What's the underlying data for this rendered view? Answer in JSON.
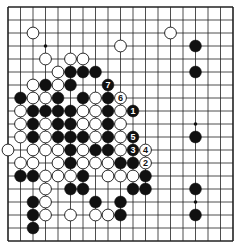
{
  "diagram": {
    "type": "go-board",
    "board_size": 19,
    "colors": {
      "black": "#111111",
      "white": "#ffffff",
      "line": "#222222",
      "background": "#ffffff"
    },
    "star_points": [
      [
        3,
        3
      ],
      [
        3,
        9
      ],
      [
        3,
        15
      ],
      [
        9,
        3
      ],
      [
        9,
        9
      ],
      [
        9,
        15
      ],
      [
        15,
        3
      ],
      [
        15,
        9
      ],
      [
        15,
        15
      ]
    ],
    "stones": [
      {
        "c": 2,
        "r": 2,
        "color": "white"
      },
      {
        "c": 13,
        "r": 2,
        "color": "white"
      },
      {
        "c": 9,
        "r": 3,
        "color": "white"
      },
      {
        "c": 15,
        "r": 3,
        "color": "black"
      },
      {
        "c": 3,
        "r": 4,
        "color": "white"
      },
      {
        "c": 5,
        "r": 4,
        "color": "white"
      },
      {
        "c": 6,
        "r": 4,
        "color": "white"
      },
      {
        "c": 4,
        "r": 5,
        "color": "white"
      },
      {
        "c": 5,
        "r": 5,
        "color": "black"
      },
      {
        "c": 6,
        "r": 5,
        "color": "black"
      },
      {
        "c": 7,
        "r": 5,
        "color": "black"
      },
      {
        "c": 15,
        "r": 5,
        "color": "black"
      },
      {
        "c": 2,
        "r": 6,
        "color": "white"
      },
      {
        "c": 3,
        "r": 6,
        "color": "black"
      },
      {
        "c": 4,
        "r": 6,
        "color": "white"
      },
      {
        "c": 5,
        "r": 6,
        "color": "black"
      },
      {
        "c": 8,
        "r": 6,
        "color": "black",
        "label": "7"
      },
      {
        "c": 1,
        "r": 7,
        "color": "black"
      },
      {
        "c": 2,
        "r": 7,
        "color": "white"
      },
      {
        "c": 3,
        "r": 7,
        "color": "white"
      },
      {
        "c": 4,
        "r": 7,
        "color": "black"
      },
      {
        "c": 6,
        "r": 7,
        "color": "black"
      },
      {
        "c": 7,
        "r": 7,
        "color": "white"
      },
      {
        "c": 8,
        "r": 7,
        "color": "black"
      },
      {
        "c": 9,
        "r": 7,
        "color": "white",
        "label": "6"
      },
      {
        "c": 1,
        "r": 8,
        "color": "white"
      },
      {
        "c": 2,
        "r": 8,
        "color": "black"
      },
      {
        "c": 3,
        "r": 8,
        "color": "black"
      },
      {
        "c": 4,
        "r": 8,
        "color": "black"
      },
      {
        "c": 5,
        "r": 8,
        "color": "black"
      },
      {
        "c": 6,
        "r": 8,
        "color": "white"
      },
      {
        "c": 7,
        "r": 8,
        "color": "white"
      },
      {
        "c": 8,
        "r": 8,
        "color": "black"
      },
      {
        "c": 9,
        "r": 8,
        "color": "white"
      },
      {
        "c": 10,
        "r": 8,
        "color": "black",
        "label": "1"
      },
      {
        "c": 1,
        "r": 9,
        "color": "white"
      },
      {
        "c": 2,
        "r": 9,
        "color": "black"
      },
      {
        "c": 3,
        "r": 9,
        "color": "white"
      },
      {
        "c": 4,
        "r": 9,
        "color": "black"
      },
      {
        "c": 5,
        "r": 9,
        "color": "black"
      },
      {
        "c": 6,
        "r": 9,
        "color": "white"
      },
      {
        "c": 7,
        "r": 9,
        "color": "white"
      },
      {
        "c": 8,
        "r": 9,
        "color": "black"
      },
      {
        "c": 9,
        "r": 9,
        "color": "white"
      },
      {
        "c": 1,
        "r": 10,
        "color": "white"
      },
      {
        "c": 2,
        "r": 10,
        "color": "black"
      },
      {
        "c": 3,
        "r": 10,
        "color": "white"
      },
      {
        "c": 4,
        "r": 10,
        "color": "black"
      },
      {
        "c": 5,
        "r": 10,
        "color": "black"
      },
      {
        "c": 6,
        "r": 10,
        "color": "black"
      },
      {
        "c": 7,
        "r": 10,
        "color": "white"
      },
      {
        "c": 8,
        "r": 10,
        "color": "black"
      },
      {
        "c": 9,
        "r": 10,
        "color": "white"
      },
      {
        "c": 10,
        "r": 10,
        "color": "black",
        "label": "5"
      },
      {
        "c": 15,
        "r": 10,
        "color": "black"
      },
      {
        "c": 0,
        "r": 11,
        "color": "white"
      },
      {
        "c": 2,
        "r": 11,
        "color": "white"
      },
      {
        "c": 3,
        "r": 11,
        "color": "white"
      },
      {
        "c": 4,
        "r": 11,
        "color": "white"
      },
      {
        "c": 5,
        "r": 11,
        "color": "black"
      },
      {
        "c": 6,
        "r": 11,
        "color": "white"
      },
      {
        "c": 7,
        "r": 11,
        "color": "black"
      },
      {
        "c": 8,
        "r": 11,
        "color": "black"
      },
      {
        "c": 9,
        "r": 11,
        "color": "white"
      },
      {
        "c": 10,
        "r": 11,
        "color": "black",
        "label": "3"
      },
      {
        "c": 11,
        "r": 11,
        "color": "white",
        "label": "4"
      },
      {
        "c": 1,
        "r": 12,
        "color": "white"
      },
      {
        "c": 2,
        "r": 12,
        "color": "white"
      },
      {
        "c": 4,
        "r": 12,
        "color": "white"
      },
      {
        "c": 5,
        "r": 12,
        "color": "black"
      },
      {
        "c": 6,
        "r": 12,
        "color": "white"
      },
      {
        "c": 7,
        "r": 12,
        "color": "white"
      },
      {
        "c": 8,
        "r": 12,
        "color": "white"
      },
      {
        "c": 9,
        "r": 12,
        "color": "black"
      },
      {
        "c": 10,
        "r": 12,
        "color": "black"
      },
      {
        "c": 11,
        "r": 12,
        "color": "white",
        "label": "2"
      },
      {
        "c": 1,
        "r": 13,
        "color": "black"
      },
      {
        "c": 2,
        "r": 13,
        "color": "black"
      },
      {
        "c": 3,
        "r": 13,
        "color": "white"
      },
      {
        "c": 4,
        "r": 13,
        "color": "white"
      },
      {
        "c": 5,
        "r": 13,
        "color": "white"
      },
      {
        "c": 6,
        "r": 13,
        "color": "black"
      },
      {
        "c": 8,
        "r": 13,
        "color": "white"
      },
      {
        "c": 9,
        "r": 13,
        "color": "white"
      },
      {
        "c": 10,
        "r": 13,
        "color": "white"
      },
      {
        "c": 11,
        "r": 13,
        "color": "black"
      },
      {
        "c": 3,
        "r": 14,
        "color": "white"
      },
      {
        "c": 5,
        "r": 14,
        "color": "black"
      },
      {
        "c": 6,
        "r": 14,
        "color": "black"
      },
      {
        "c": 10,
        "r": 14,
        "color": "black"
      },
      {
        "c": 11,
        "r": 14,
        "color": "black"
      },
      {
        "c": 15,
        "r": 14,
        "color": "black"
      },
      {
        "c": 2,
        "r": 15,
        "color": "black"
      },
      {
        "c": 3,
        "r": 15,
        "color": "white"
      },
      {
        "c": 7,
        "r": 15,
        "color": "black"
      },
      {
        "c": 9,
        "r": 15,
        "color": "black"
      },
      {
        "c": 2,
        "r": 16,
        "color": "black"
      },
      {
        "c": 3,
        "r": 16,
        "color": "white"
      },
      {
        "c": 5,
        "r": 16,
        "color": "white"
      },
      {
        "c": 7,
        "r": 16,
        "color": "white"
      },
      {
        "c": 8,
        "r": 16,
        "color": "white"
      },
      {
        "c": 9,
        "r": 16,
        "color": "black"
      },
      {
        "c": 15,
        "r": 16,
        "color": "black"
      },
      {
        "c": 2,
        "r": 17,
        "color": "black"
      }
    ]
  }
}
